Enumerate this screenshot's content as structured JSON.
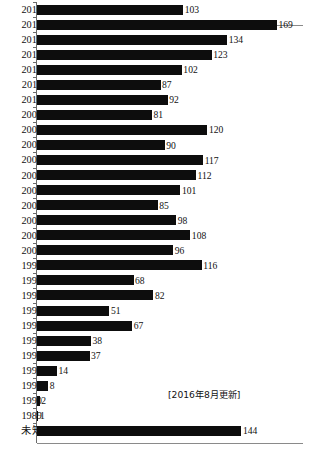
{
  "chart_data": {
    "type": "bar",
    "orientation": "horizontal",
    "title": "",
    "subtitle": "",
    "xlabel": "",
    "ylabel": "",
    "grid": false,
    "legend": null,
    "xlim": [
      0,
      190
    ],
    "annotations": [
      "[2016年8月更新]"
    ],
    "categories": [
      "2016",
      "2015",
      "2014",
      "2013",
      "2012",
      "2011",
      "2010",
      "2009",
      "2008",
      "2007",
      "2006",
      "2005",
      "2004",
      "2003",
      "2002",
      "2001",
      "2000",
      "1999",
      "1998",
      "1997",
      "1996",
      "1995",
      "1994",
      "1993",
      "1992",
      "1991",
      "1990",
      "1989",
      "未知"
    ],
    "values": [
      103,
      169,
      134,
      123,
      102,
      87,
      92,
      81,
      120,
      90,
      117,
      112,
      101,
      85,
      98,
      108,
      96,
      116,
      68,
      82,
      51,
      67,
      38,
      37,
      14,
      8,
      2,
      1,
      144
    ],
    "bar_color": "#0d0d0d",
    "axis_color": "#6b6b6b"
  },
  "annotation": {
    "text": "[2016年8月更新]"
  },
  "rows": [
    {
      "label": "2016",
      "value": "103"
    },
    {
      "label": "2015",
      "value": "169"
    },
    {
      "label": "2014",
      "value": "134"
    },
    {
      "label": "2013",
      "value": "123"
    },
    {
      "label": "2012",
      "value": "102"
    },
    {
      "label": "2011",
      "value": "87"
    },
    {
      "label": "2010",
      "value": "92"
    },
    {
      "label": "2009",
      "value": "81"
    },
    {
      "label": "2008",
      "value": "120"
    },
    {
      "label": "2007",
      "value": "90"
    },
    {
      "label": "2006",
      "value": "117"
    },
    {
      "label": "2005",
      "value": "112"
    },
    {
      "label": "2004",
      "value": "101"
    },
    {
      "label": "2003",
      "value": "85"
    },
    {
      "label": "2002",
      "value": "98"
    },
    {
      "label": "2001",
      "value": "108"
    },
    {
      "label": "2000",
      "value": "96"
    },
    {
      "label": "1999",
      "value": "116"
    },
    {
      "label": "1998",
      "value": "68"
    },
    {
      "label": "1997",
      "value": "82"
    },
    {
      "label": "1996",
      "value": "51"
    },
    {
      "label": "1995",
      "value": "67"
    },
    {
      "label": "1994",
      "value": "38"
    },
    {
      "label": "1993",
      "value": "37"
    },
    {
      "label": "1992",
      "value": "14"
    },
    {
      "label": "1991",
      "value": "8"
    },
    {
      "label": "1990",
      "value": "2"
    },
    {
      "label": "1989",
      "value": "1"
    },
    {
      "label": "未知",
      "value": "144"
    }
  ]
}
